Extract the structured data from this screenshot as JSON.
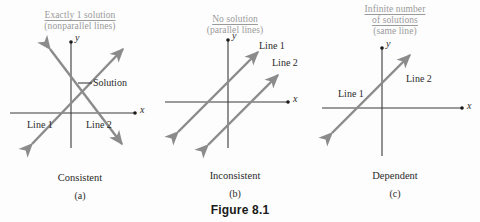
{
  "figure": {
    "caption": "Figure 8.1"
  },
  "colors": {
    "line_gray": "#8b8b8b",
    "axis_black": "#3a3a3a",
    "header_gray": "#9a9a9a",
    "text_black": "#2a2a2a",
    "background": "#fdfdfd"
  },
  "panels": [
    {
      "id": "a",
      "header_lines": [
        "Exactly 1 solution",
        "(nonparallel lines)"
      ],
      "axis_x_label": "x",
      "axis_y_label": "y",
      "line_labels": [
        "Line 1",
        "Line 2"
      ],
      "annotation": "Solution",
      "classification": "Consistent",
      "letter": "(a)"
    },
    {
      "id": "b",
      "header_lines": [
        "No solution",
        "(parallel lines)"
      ],
      "axis_x_label": "x",
      "axis_y_label": "y",
      "line_labels": [
        "Line 1",
        "Line 2"
      ],
      "classification": "Inconsistent",
      "letter": "(b)"
    },
    {
      "id": "c",
      "header_lines": [
        "Infinite number",
        "of solutions",
        "(same line)"
      ],
      "axis_x_label": "x",
      "axis_y_label": "y",
      "line_labels": [
        "Line 1",
        "Line 2"
      ],
      "classification": "Dependent",
      "letter": "(c)"
    }
  ]
}
